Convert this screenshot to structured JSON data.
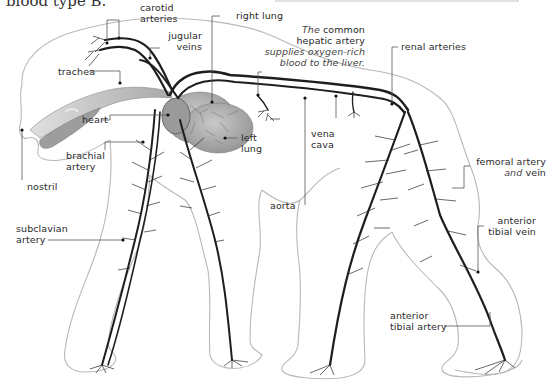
{
  "caption": {
    "text": "blood type B."
  },
  "annotation_box": {
    "line1_italic": "The",
    "line1_rest": " common",
    "line2": "hepatic artery",
    "line3": "supplies oxygen-rich",
    "line4": "blood to the liver."
  },
  "labels": {
    "carotid": [
      "carotid",
      "arteries"
    ],
    "jugular": [
      "jugular",
      "veins"
    ],
    "right_lung": "right lung",
    "renal": "renal arteries",
    "trachea": "trachea",
    "heart": "heart",
    "brachial": [
      "brachial",
      "artery"
    ],
    "left_lung": [
      "left",
      "lung"
    ],
    "vena_cava": [
      "vena",
      "cava"
    ],
    "nostril": "nostril",
    "femoral": {
      "line1": "femoral artery",
      "line2_italic": "and",
      "line2_rest": " vein"
    },
    "aorta": "aorta",
    "subclavian": [
      "subclavian",
      "artery"
    ],
    "anterior_tibial_vein": [
      "anterior",
      "tibial vein"
    ],
    "anterior_tibial_artery": [
      "anterior",
      "tibial artery"
    ]
  },
  "colors": {
    "outline": "#b5b5b5",
    "vessel": "#1e1e1e",
    "leader": "#555555",
    "lung": "#9a9a9a",
    "trachea": "#bdbdbd"
  }
}
